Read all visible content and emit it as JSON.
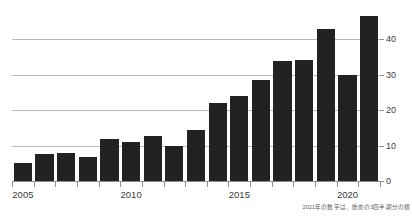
{
  "chart_data": {
    "type": "bar",
    "title": "",
    "subtitle": "",
    "xlabel": "",
    "ylabel": "",
    "categories": [
      "2005",
      "2006",
      "2007",
      "2008",
      "2009",
      "2010",
      "2011",
      "2012",
      "2013",
      "2014",
      "2015",
      "2016",
      "2017",
      "2018",
      "2019",
      "2020",
      "2021"
    ],
    "values": [
      5,
      7.5,
      7.8,
      6.8,
      12,
      11,
      12.8,
      10,
      14.5,
      22,
      24,
      28.5,
      34,
      34.3,
      43,
      30,
      46.5
    ],
    "ylim": [
      0,
      48
    ],
    "y_ticks": [
      0,
      10,
      20,
      30,
      40
    ],
    "y_tick_labels": [
      "0",
      "10",
      "20",
      "30",
      "40"
    ],
    "y_axis_position": "right",
    "x_tick_labels_shown": [
      "2005",
      "2010",
      "2015",
      "2020"
    ],
    "x_tick_label_indices": [
      0,
      5,
      10,
      15
    ],
    "grid": true,
    "grid_axis": "y",
    "legend": "none",
    "bar_color": "#222222",
    "gridline_color": "#b9b9b9",
    "axis_color": "#8d8d8d",
    "background_color": "#ffffff",
    "annotations": [
      {
        "text": "2021年の数字は、始めの3四半期分の額",
        "position": "bottom-right"
      }
    ]
  },
  "footnote": {
    "text": "2021年の数字は、始めの3四半期分の額"
  }
}
